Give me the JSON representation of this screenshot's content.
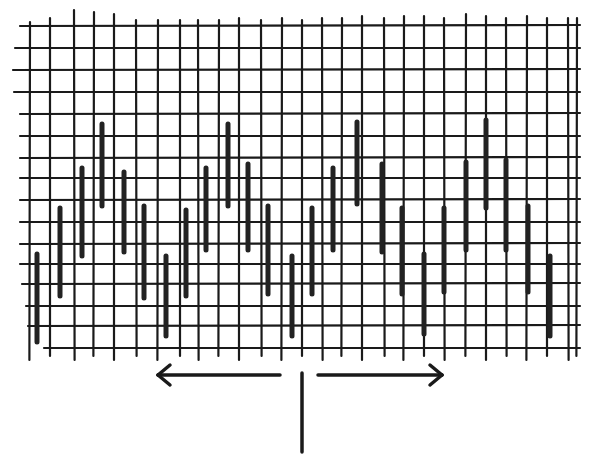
{
  "diagram": {
    "colors": {
      "ink": "#1a1a1a",
      "bar": "#222222",
      "background": "#ffffff"
    },
    "grid": {
      "vertical_lines_x": [
        30,
        50,
        74,
        94,
        114,
        136,
        158,
        180,
        198,
        219,
        239,
        261,
        282,
        302,
        322,
        342,
        362,
        384,
        404,
        424,
        444,
        466,
        486,
        506,
        527,
        547,
        568,
        577
      ],
      "vertical_top_y": [
        22,
        18,
        10,
        12,
        14,
        20,
        20,
        20,
        20,
        20,
        18,
        20,
        18,
        20,
        18,
        18,
        16,
        18,
        16,
        16,
        18,
        14,
        16,
        18,
        16,
        18,
        18,
        18
      ],
      "vertical_bottom_y": 360,
      "horizontal_lines_y": [
        26,
        48,
        70,
        92,
        114,
        136,
        158,
        178,
        200,
        222,
        244,
        264,
        284,
        306,
        326,
        348
      ],
      "horizontal_left_x": [
        20,
        15,
        13,
        14,
        20,
        20,
        20,
        20,
        20,
        20,
        20,
        20,
        22,
        26,
        28,
        44
      ],
      "horizontal_right_x": 580
    },
    "bars": [
      {
        "x": 37,
        "top": 254,
        "bottom": 342
      },
      {
        "x": 60,
        "top": 208,
        "bottom": 296
      },
      {
        "x": 82,
        "top": 168,
        "bottom": 256
      },
      {
        "x": 102,
        "top": 124,
        "bottom": 206
      },
      {
        "x": 124,
        "top": 172,
        "bottom": 252
      },
      {
        "x": 144,
        "top": 206,
        "bottom": 298
      },
      {
        "x": 166,
        "top": 256,
        "bottom": 336
      },
      {
        "x": 186,
        "top": 210,
        "bottom": 296
      },
      {
        "x": 206,
        "top": 168,
        "bottom": 250
      },
      {
        "x": 228,
        "top": 124,
        "bottom": 206
      },
      {
        "x": 248,
        "top": 164,
        "bottom": 250
      },
      {
        "x": 268,
        "top": 206,
        "bottom": 294
      },
      {
        "x": 292,
        "top": 256,
        "bottom": 336
      },
      {
        "x": 312,
        "top": 208,
        "bottom": 294
      },
      {
        "x": 333,
        "top": 168,
        "bottom": 250
      },
      {
        "x": 357,
        "top": 122,
        "bottom": 204
      },
      {
        "x": 382,
        "top": 164,
        "bottom": 252
      },
      {
        "x": 402,
        "top": 208,
        "bottom": 294
      },
      {
        "x": 424,
        "top": 254,
        "bottom": 334
      },
      {
        "x": 444,
        "top": 208,
        "bottom": 292
      },
      {
        "x": 466,
        "top": 162,
        "bottom": 250
      },
      {
        "x": 486,
        "top": 120,
        "bottom": 208
      },
      {
        "x": 506,
        "top": 160,
        "bottom": 250
      },
      {
        "x": 528,
        "top": 206,
        "bottom": 292
      },
      {
        "x": 550,
        "top": 256,
        "bottom": 336
      }
    ],
    "annotations": {
      "left_arrow": {
        "x1": 280,
        "x2": 158,
        "y": 375,
        "direction": "left"
      },
      "right_arrow": {
        "x1": 318,
        "x2": 442,
        "y": 375,
        "direction": "right"
      },
      "center_mark": {
        "x": 302,
        "y1": 373,
        "y2": 452
      }
    }
  }
}
